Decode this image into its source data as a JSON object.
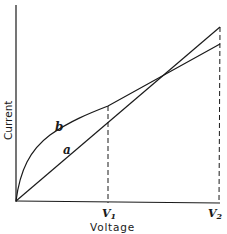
{
  "diagram": {
    "type": "current-voltage characteristic",
    "axes": {
      "x_label": "Voltage",
      "y_label": "Current"
    },
    "curves": [
      {
        "id": "a",
        "label": "a",
        "shape": "straight line through origin"
      },
      {
        "id": "b",
        "label": "b",
        "shape": "curve rising steeply then linear"
      }
    ],
    "markers": [
      {
        "label": "V",
        "subscript": "1",
        "style": "dashed vertical"
      },
      {
        "label": "V",
        "subscript": "2",
        "style": "dashed vertical"
      }
    ],
    "colors": {
      "ink": "#1a1a1a",
      "background": "#ffffff"
    }
  }
}
